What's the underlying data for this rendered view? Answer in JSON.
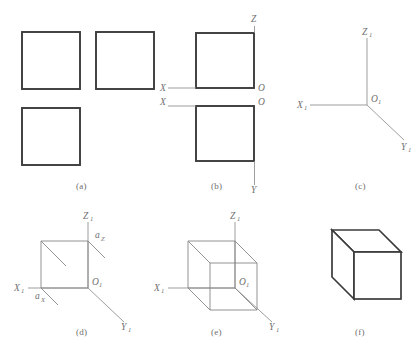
{
  "figure": {
    "title_caption": "",
    "panels": [
      {
        "id": "a",
        "caption": "(a)"
      },
      {
        "id": "b",
        "caption": "(b)"
      },
      {
        "id": "c",
        "caption": "(c)"
      },
      {
        "id": "d",
        "caption": "(d)"
      },
      {
        "id": "e",
        "caption": "(e)"
      },
      {
        "id": "f",
        "caption": "(f)"
      }
    ]
  },
  "panel_a": {
    "caption": "(a)",
    "description": "three-orthographic-views-squares",
    "squares": [
      {
        "name": "front-view-square"
      },
      {
        "name": "side-view-square"
      },
      {
        "name": "top-view-square"
      }
    ]
  },
  "panel_b": {
    "caption": "(b)",
    "labels": {
      "z": "Z",
      "x_upper": "X",
      "o_upper": "O",
      "x_lower": "X",
      "o_lower": "O",
      "y": "Y"
    }
  },
  "panel_c": {
    "caption": "(c)",
    "labels": {
      "z1": "Z",
      "z1_sub": "1",
      "x1": "X",
      "x1_sub": "1",
      "o1": "O",
      "o1_sub": "1",
      "y1": "Y",
      "y1_sub": "1"
    }
  },
  "panel_d": {
    "caption": "(d)",
    "labels": {
      "z1": "Z",
      "z1_sub": "1",
      "x1": "X",
      "x1_sub": "1",
      "o1": "O",
      "o1_sub": "1",
      "y1": "Y",
      "y1_sub": "1",
      "az": "a",
      "az_sub": "Z",
      "ax": "a",
      "ax_sub": "X"
    }
  },
  "panel_e": {
    "caption": "(e)",
    "labels": {
      "z1": "Z",
      "z1_sub": "1",
      "x1": "X",
      "x1_sub": "1",
      "o1": "O",
      "o1_sub": "1",
      "y1": "Y",
      "y1_sub": "1"
    }
  },
  "panel_f": {
    "caption": "(f)",
    "description": "finished-solid-cube"
  },
  "colors": {
    "thick_edge": "#3b3b3b",
    "thin_line": "#8c8c8c",
    "wire_edge": "#878787",
    "label_text": "#6f6f6f",
    "caption_text": "#6d6d6d",
    "background": "#ffffff"
  }
}
